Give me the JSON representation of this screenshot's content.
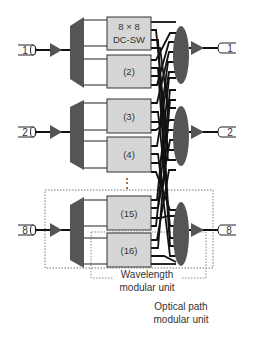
{
  "colors": {
    "box_fill": "#d6d6d6",
    "device_fill": "#555555",
    "line": "#111111",
    "dotted": "#777777"
  },
  "inputs": [
    {
      "label": "1"
    },
    {
      "label": "2"
    },
    {
      "label": "8"
    }
  ],
  "outputs": [
    {
      "label": "1"
    },
    {
      "label": "2"
    },
    {
      "label": "8"
    }
  ],
  "switches": [
    {
      "line1": "8 × 8",
      "line2": "DC-SW"
    },
    {
      "line1": "(2)"
    },
    {
      "line1": "(3)"
    },
    {
      "line1": "(4)"
    },
    {
      "line1": "(15)"
    },
    {
      "line1": "(16)"
    }
  ],
  "ellipsis": "⋮",
  "annotations": {
    "wavelength_unit": {
      "line1": "Wavelength",
      "line2": "modular unit"
    },
    "optical_path_unit": {
      "line1": "Optical path",
      "line2": "modular unit"
    }
  }
}
